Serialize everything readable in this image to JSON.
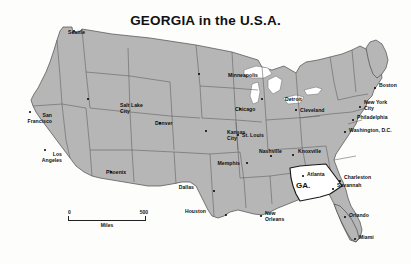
{
  "map": {
    "title": "GEORGIA in the U.S.A.",
    "highlight_state": {
      "abbr": "GA.",
      "name": "Georgia",
      "fill": "#ffffff"
    },
    "colors": {
      "land": "#b6b6b6",
      "water": "#ffffff",
      "border": "#4a4a4a",
      "text": "#0d0d0d",
      "background": "#fdfdfc"
    },
    "scale": {
      "min": "0",
      "max": "500",
      "units": "Miles"
    },
    "cities": [
      {
        "name": "Seattle",
        "lines": [
          "Seattle"
        ],
        "x": 74,
        "y": 31,
        "dx": 68,
        "dy": 33,
        "align": "left"
      },
      {
        "name": "San Francisco",
        "lines": [
          "San",
          "Francisco"
        ],
        "x": 30,
        "y": 112,
        "dx": 52,
        "dy": 116,
        "align": "right"
      },
      {
        "name": "Los Angeles",
        "lines": [
          "Los",
          "Angeles"
        ],
        "x": 45,
        "y": 150,
        "dx": 62,
        "dy": 155,
        "align": "right"
      },
      {
        "name": "Salt Lake City",
        "lines": [
          "Salt Lake",
          "City"
        ],
        "x": 88,
        "y": 99,
        "dx": 120,
        "dy": 106,
        "align": "left"
      },
      {
        "name": "Phoenix",
        "lines": [
          "Phoenix"
        ],
        "x": 111,
        "y": 172,
        "dx": 106,
        "dy": 173,
        "align": "left"
      },
      {
        "name": "Denver",
        "lines": [
          "Denver"
        ],
        "x": 160,
        "y": 123,
        "dx": 155,
        "dy": 124,
        "align": "left"
      },
      {
        "name": "Minneapolis",
        "lines": [
          "Minneapolis"
        ],
        "x": 199,
        "y": 74,
        "dx": 228,
        "dy": 76,
        "align": "left"
      },
      {
        "name": "Kansas City",
        "lines": [
          "Kansas",
          "City"
        ],
        "x": 206,
        "y": 131,
        "dx": 227,
        "dy": 133,
        "align": "left"
      },
      {
        "name": "Chicago",
        "lines": [
          "Chicago"
        ],
        "x": 240,
        "y": 109,
        "dx": 235,
        "dy": 110,
        "align": "left"
      },
      {
        "name": "Detroit",
        "lines": [
          "Detroit"
        ],
        "x": 262,
        "y": 99,
        "dx": 285,
        "dy": 100,
        "align": "left"
      },
      {
        "name": "Cleveland",
        "lines": [
          "Cleveland"
        ],
        "x": 296,
        "y": 110,
        "dx": 300,
        "dy": 111,
        "align": "left"
      },
      {
        "name": "St. Louis",
        "lines": [
          "St. Louis"
        ],
        "x": 238,
        "y": 135,
        "dx": 242,
        "dy": 136,
        "align": "left"
      },
      {
        "name": "Memphis",
        "lines": [
          "Memphis"
        ],
        "x": 247,
        "y": 163,
        "dx": 240,
        "dy": 164,
        "align": "right"
      },
      {
        "name": "Nashville",
        "lines": [
          "Nashville"
        ],
        "x": 271,
        "y": 156,
        "dx": 259,
        "dy": 152,
        "align": "left"
      },
      {
        "name": "Knoxville",
        "lines": [
          "Knoxville"
        ],
        "x": 293,
        "y": 155,
        "dx": 298,
        "dy": 152,
        "align": "left"
      },
      {
        "name": "Atlanta",
        "lines": [
          "Atlanta"
        ],
        "x": 303,
        "y": 176,
        "dx": 307,
        "dy": 175,
        "align": "left"
      },
      {
        "name": "Charleston",
        "lines": [
          "Charleston"
        ],
        "x": 340,
        "y": 181,
        "dx": 344,
        "dy": 178,
        "align": "left"
      },
      {
        "name": "Savannah",
        "lines": [
          "Savannah"
        ],
        "x": 333,
        "y": 189,
        "dx": 337,
        "dy": 186,
        "align": "left"
      },
      {
        "name": "Orlando",
        "lines": [
          "Orlando"
        ],
        "x": 345,
        "y": 217,
        "dx": 349,
        "dy": 216,
        "align": "left"
      },
      {
        "name": "Miami",
        "lines": [
          "Miami"
        ],
        "x": 355,
        "y": 239,
        "dx": 359,
        "dy": 238,
        "align": "left"
      },
      {
        "name": "Dallas",
        "lines": [
          "Dallas"
        ],
        "x": 214,
        "y": 191,
        "dx": 194,
        "dy": 188,
        "align": "right"
      },
      {
        "name": "Houston",
        "lines": [
          "Houston"
        ],
        "x": 226,
        "y": 215,
        "dx": 206,
        "dy": 212,
        "align": "right"
      },
      {
        "name": "New Orleans",
        "lines": [
          "New",
          "Orleans"
        ],
        "x": 261,
        "y": 216,
        "dx": 265,
        "dy": 214,
        "align": "left"
      },
      {
        "name": "Washington, D.C.",
        "lines": [
          "Washington, D.C."
        ],
        "x": 345,
        "y": 132,
        "dx": 349,
        "dy": 131,
        "align": "left"
      },
      {
        "name": "Philadelphia",
        "lines": [
          "Philadelphia"
        ],
        "x": 353,
        "y": 120,
        "dx": 357,
        "dy": 118,
        "align": "left"
      },
      {
        "name": "New York City",
        "lines": [
          "New York",
          "City"
        ],
        "x": 360,
        "y": 107,
        "dx": 364,
        "dy": 103,
        "align": "left"
      },
      {
        "name": "Boston",
        "lines": [
          "Boston"
        ],
        "x": 375,
        "y": 88,
        "dx": 379,
        "dy": 86,
        "align": "left"
      }
    ]
  }
}
